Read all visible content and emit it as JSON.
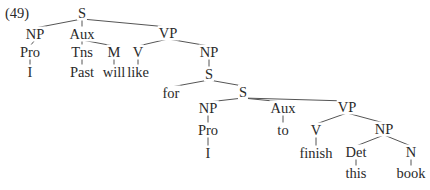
{
  "example_number": "(49)",
  "colors": {
    "line": "#555555",
    "text": "#2a2a2a",
    "background": "#ffffff"
  },
  "nodes": {
    "s_root": {
      "label": "S",
      "x": 82,
      "y": 13
    },
    "np1": {
      "label": "NP",
      "x": 35,
      "y": 34
    },
    "pro1": {
      "label": "Pro",
      "x": 30,
      "y": 52
    },
    "i1": {
      "label": "I",
      "x": 30,
      "y": 72
    },
    "aux1": {
      "label": "Aux",
      "x": 82,
      "y": 34
    },
    "tns": {
      "label": "Tns",
      "x": 82,
      "y": 52
    },
    "past": {
      "label": "Past",
      "x": 82,
      "y": 72
    },
    "m": {
      "label": "M",
      "x": 114,
      "y": 52
    },
    "will": {
      "label": "will",
      "x": 114,
      "y": 72
    },
    "vp1": {
      "label": "VP",
      "x": 168,
      "y": 33
    },
    "v1": {
      "label": "V",
      "x": 138,
      "y": 52
    },
    "like": {
      "label": "like",
      "x": 138,
      "y": 72
    },
    "np2": {
      "label": "NP",
      "x": 209,
      "y": 52
    },
    "s2": {
      "label": "S",
      "x": 209,
      "y": 74
    },
    "for": {
      "label": "for",
      "x": 171,
      "y": 93
    },
    "s3": {
      "label": "S",
      "x": 243,
      "y": 92
    },
    "np3": {
      "label": "NP",
      "x": 208,
      "y": 108
    },
    "pro2": {
      "label": "Pro",
      "x": 208,
      "y": 130
    },
    "i2": {
      "label": "I",
      "x": 208,
      "y": 153
    },
    "aux2": {
      "label": "Aux",
      "x": 283,
      "y": 108
    },
    "to": {
      "label": "to",
      "x": 283,
      "y": 130
    },
    "vp2": {
      "label": "VP",
      "x": 347,
      "y": 107
    },
    "v2": {
      "label": "V",
      "x": 316,
      "y": 130
    },
    "finish": {
      "label": "finish",
      "x": 316,
      "y": 153
    },
    "np4": {
      "label": "NP",
      "x": 384,
      "y": 129
    },
    "det": {
      "label": "Det",
      "x": 356,
      "y": 152
    },
    "this": {
      "label": "this",
      "x": 356,
      "y": 173
    },
    "n": {
      "label": "N",
      "x": 411,
      "y": 152
    },
    "book": {
      "label": "book",
      "x": 411,
      "y": 173
    }
  },
  "edges": [
    [
      "s_root",
      "np1"
    ],
    [
      "s_root",
      "aux1"
    ],
    [
      "s_root",
      "vp1"
    ],
    [
      "np1",
      "pro1"
    ],
    [
      "pro1",
      "i1"
    ],
    [
      "aux1",
      "tns"
    ],
    [
      "tns",
      "past"
    ],
    [
      "aux1",
      "m"
    ],
    [
      "m",
      "will"
    ],
    [
      "vp1",
      "v1"
    ],
    [
      "v1",
      "like"
    ],
    [
      "vp1",
      "np2"
    ],
    [
      "np2",
      "s2"
    ],
    [
      "s2",
      "for"
    ],
    [
      "s2",
      "s3"
    ],
    [
      "s3",
      "np3"
    ],
    [
      "s3",
      "aux2"
    ],
    [
      "s3",
      "vp2"
    ],
    [
      "np3",
      "pro2"
    ],
    [
      "pro2",
      "i2"
    ],
    [
      "aux2",
      "to"
    ],
    [
      "vp2",
      "v2"
    ],
    [
      "v2",
      "finish"
    ],
    [
      "vp2",
      "np4"
    ],
    [
      "np4",
      "det"
    ],
    [
      "det",
      "this"
    ],
    [
      "np4",
      "n"
    ],
    [
      "n",
      "book"
    ]
  ]
}
